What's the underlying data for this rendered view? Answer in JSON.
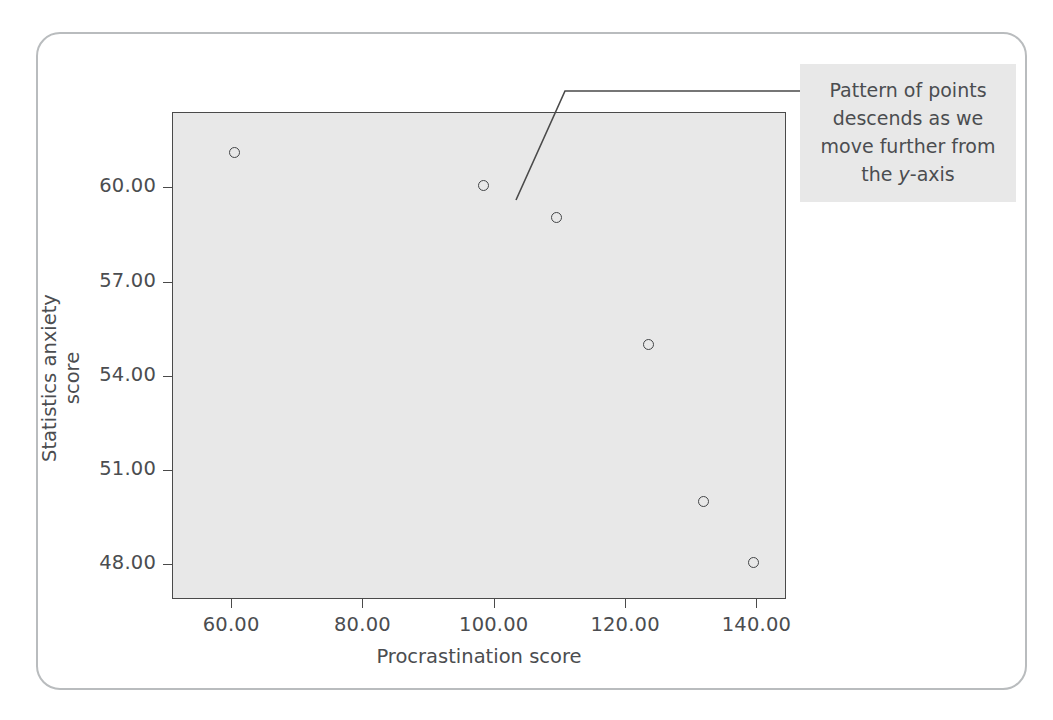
{
  "figure": {
    "ghost_texts": [
      {
        "text": "ib  Scatterrams",
        "x": 560,
        "y": 36,
        "size": 30,
        "weight": "bold"
      },
      {
        "text": "procrastination and statistics anxiety. A scatterplot",
        "x": 40,
        "y": 150,
        "size": 17
      },
      {
        "text": "is a graph of the scores of one variable against the",
        "x": 40,
        "y": 172,
        "size": 17
      },
      {
        "text": "scores of another. Here the procrastination score",
        "x": 40,
        "y": 194,
        "size": 17
      },
      {
        "text": "Procrastination score:  80   61   140   99   124   110   132",
        "x": 90,
        "y": 258,
        "size": 17
      },
      {
        "text": "Statistics anxiety:  60   51   48   57   55   59   50",
        "x": 90,
        "y": 288,
        "size": 17
      },
      {
        "text": "a scatterplot we plot one variable on the x-axis and",
        "x": 40,
        "y": 338,
        "size": 17
      },
      {
        "text": "the other on the y-axis, then for each person we",
        "x": 40,
        "y": 366,
        "size": 17
      },
      {
        "text": "plot a point at the intersection of their two scores.",
        "x": 40,
        "y": 394,
        "size": 17
      },
      {
        "text": "The resulting pattern of dots tells us about the",
        "x": 40,
        "y": 422,
        "size": 17
      },
      {
        "text": "relationship between the two variables. Here the",
        "x": 40,
        "y": 450,
        "size": 17
      },
      {
        "text": "points descend as we move further along the x-axis.",
        "x": 40,
        "y": 478,
        "size": 17
      }
    ]
  },
  "chart_data": {
    "type": "scatter",
    "title": "",
    "xlabel": "Procrastination score",
    "ylabel": "Statistics anxiety score",
    "xlim": [
      51,
      144.5
    ],
    "ylim": [
      46.9,
      62.4
    ],
    "xticks": [
      60,
      80,
      100,
      120,
      140
    ],
    "xticklabels": [
      "60.00",
      "80.00",
      "100.00",
      "120.00",
      "140.00"
    ],
    "yticks": [
      48,
      51,
      54,
      57,
      60
    ],
    "yticklabels": [
      "48.00",
      "51.00",
      "54.00",
      "57.00",
      "60.00"
    ],
    "grid": false,
    "legend": null,
    "marker": {
      "shape": "circle-open",
      "edge_color": "#434547",
      "size_px": 11
    },
    "plot_background": "#e8e8e8",
    "points": [
      {
        "x": 60.5,
        "y": 61.1
      },
      {
        "x": 98.5,
        "y": 60.05
      },
      {
        "x": 109.5,
        "y": 59.05
      },
      {
        "x": 123.5,
        "y": 55.0
      },
      {
        "x": 132.0,
        "y": 50.0
      },
      {
        "x": 139.5,
        "y": 48.05
      }
    ],
    "annotations": [
      {
        "name": "descending-pattern-note",
        "text_before_italic": "Pattern of points descends as we move further from the ",
        "italic_part": "y",
        "text_after_italic": "-axis",
        "full_text": "Pattern of points descends as we move further from the y-axis",
        "points_to": {
          "x": 105,
          "y": 59.7
        }
      }
    ]
  },
  "colors": {
    "card_border": "#b9bcbe",
    "plot_fill": "#e8e8e8",
    "axis_line": "#4a4a4a",
    "text": "#4b4d50",
    "marker_edge": "#434547",
    "annotation_fill": "#e8e8e8"
  }
}
